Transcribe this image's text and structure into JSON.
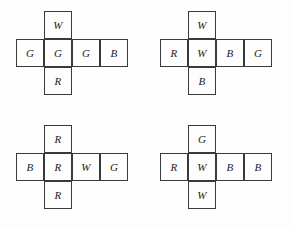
{
  "figure": {
    "type": "cube-nets",
    "background_color": "#fdfdfd",
    "line_color": "#3a3a3a",
    "text_color": "#1c1c1c",
    "cell_size_px": 28,
    "nets": [
      {
        "id": "net-top-left",
        "origin": {
          "x": 16,
          "y": 11
        },
        "shape": "cross-4x3",
        "cells": [
          {
            "name": "top",
            "col": 1,
            "row": 0,
            "label": "W"
          },
          {
            "name": "left",
            "col": 0,
            "row": 1,
            "label": "G"
          },
          {
            "name": "center",
            "col": 1,
            "row": 1,
            "label": "G"
          },
          {
            "name": "right",
            "col": 2,
            "row": 1,
            "label": "G"
          },
          {
            "name": "far-right",
            "col": 3,
            "row": 1,
            "label": "B"
          },
          {
            "name": "bottom",
            "col": 1,
            "row": 2,
            "label": "R"
          }
        ]
      },
      {
        "id": "net-top-right",
        "origin": {
          "x": 160,
          "y": 11
        },
        "shape": "cross-4x3",
        "cells": [
          {
            "name": "top",
            "col": 1,
            "row": 0,
            "label": "W"
          },
          {
            "name": "left",
            "col": 0,
            "row": 1,
            "label": "R"
          },
          {
            "name": "center",
            "col": 1,
            "row": 1,
            "label": "W"
          },
          {
            "name": "right",
            "col": 2,
            "row": 1,
            "label": "B"
          },
          {
            "name": "far-right",
            "col": 3,
            "row": 1,
            "label": "G"
          },
          {
            "name": "bottom",
            "col": 1,
            "row": 2,
            "label": "B"
          }
        ]
      },
      {
        "id": "net-bottom-left",
        "origin": {
          "x": 16,
          "y": 125
        },
        "shape": "cross-4x3",
        "cells": [
          {
            "name": "top",
            "col": 1,
            "row": 0,
            "label": "R"
          },
          {
            "name": "left",
            "col": 0,
            "row": 1,
            "label": "B"
          },
          {
            "name": "center",
            "col": 1,
            "row": 1,
            "label": "R"
          },
          {
            "name": "right",
            "col": 2,
            "row": 1,
            "label": "W"
          },
          {
            "name": "far-right",
            "col": 3,
            "row": 1,
            "label": "G"
          },
          {
            "name": "bottom",
            "col": 1,
            "row": 2,
            "label": "R"
          }
        ]
      },
      {
        "id": "net-bottom-right",
        "origin": {
          "x": 160,
          "y": 125
        },
        "shape": "cross-4x3",
        "cells": [
          {
            "name": "top",
            "col": 1,
            "row": 0,
            "label": "G"
          },
          {
            "name": "left",
            "col": 0,
            "row": 1,
            "label": "R"
          },
          {
            "name": "center",
            "col": 1,
            "row": 1,
            "label": "W"
          },
          {
            "name": "right",
            "col": 2,
            "row": 1,
            "label": "B"
          },
          {
            "name": "far-right",
            "col": 3,
            "row": 1,
            "label": "B"
          },
          {
            "name": "bottom",
            "col": 1,
            "row": 2,
            "label": "W"
          }
        ]
      }
    ]
  }
}
